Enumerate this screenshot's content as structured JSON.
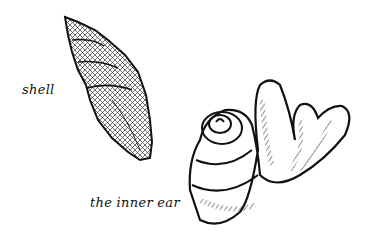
{
  "illustration": {
    "labels": {
      "shell": "shell",
      "inner_ear": "the inner ear"
    },
    "figures": [
      "spiral-shell",
      "inner-ear-cochlea"
    ],
    "colors": {
      "ink": "#111111",
      "background": "#ffffff"
    }
  }
}
